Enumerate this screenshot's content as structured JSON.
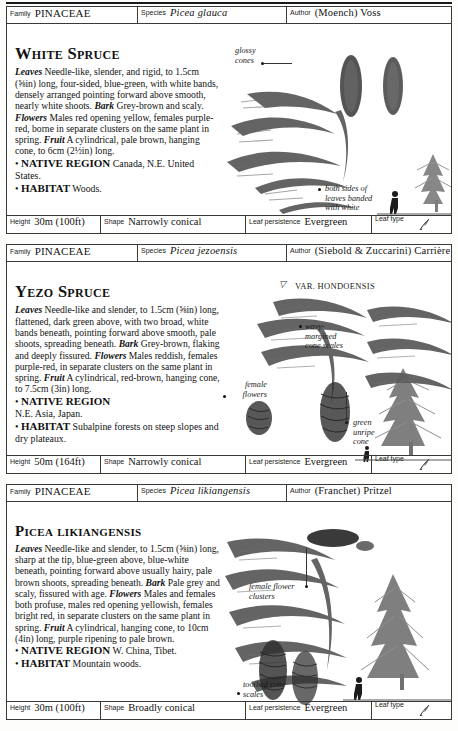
{
  "labels": {
    "family": "Family",
    "species": "Species",
    "author": "Author",
    "height": "Height",
    "shape": "Shape",
    "leaf_persistence": "Leaf persistence",
    "leaf_type": "Leaf type"
  },
  "entries": [
    {
      "family": "PINACEAE",
      "species": "Picea glauca",
      "author": "(Moench) Voss",
      "common_name": "White Spruce",
      "description": "Leaves Needle-like, slender, and rigid, to 1.5cm (⅝in) long, four-sided, blue-green, with white bands, densely arranged pointing forward above smooth, nearly white shoots. Bark Grey-brown and scaly. Flowers Males red opening yellow, females purple-red, borne in separate clusters on the same plant in spring. Fruit A cylindrical, pale brown, hanging cone, to 6cm (2½in) long.",
      "native_region_label": "NATIVE REGION",
      "native_region": "Canada, N.E. United States.",
      "habitat_label": "HABITAT",
      "habitat": "Woods.",
      "height": "30m (100ft)",
      "shape": "Narrowly conical",
      "leaf_persistence": "Evergreen",
      "callouts": [
        {
          "text": "glossy\ncones"
        },
        {
          "text": "both sides of\nleaves banded\nwith white"
        }
      ]
    },
    {
      "family": "PINACEAE",
      "species": "Picea jezoensis",
      "author": "(Siebold & Zuccarini) Carrière",
      "common_name": "Yezo Spruce",
      "variety_label": "VAR. HONDOENSIS",
      "description": "Leaves Needle-like and slender, to 1.5cm (⅝in) long, flattened, dark green above, with two broad, white bands beneath, pointing forward above smooth, pale shoots, spreading beneath. Bark Grey-brown, flaking and deeply fissured. Flowers Males reddish, females purple-red, in separate clusters on the same plant in spring. Fruit A cylindrical, red-brown, hanging cone, to 7.5cm (3in) long.",
      "native_region_label": "NATIVE REGION",
      "native_region": "N.E. Asia, Japan.",
      "habitat_label": "HABITAT",
      "habitat": "Subalpine forests on steep slopes and dry plateaux.",
      "height": "50m (164ft)",
      "shape": "Narrowly conical",
      "leaf_persistence": "Evergreen",
      "callouts": [
        {
          "text": "female\nflowers"
        },
        {
          "text": "wavy-\nmargined\ncone scales"
        },
        {
          "text": "green\nunripe\ncone"
        }
      ]
    },
    {
      "family": "PINACEAE",
      "species": "Picea likiangensis",
      "author": "(Franchet) Pritzel",
      "common_name": "Picea likiangensis",
      "description": "Leaves Needle-like and slender, to 1.5cm (⅝in) long, sharp at the tip, blue-green above, blue-white beneath, pointing forward above usually hairy, pale brown shoots, spreading beneath. Bark Pale grey and scaly, fissured with age. Flowers Males and females both profuse, males red opening yellowish, females bright red, in separate clusters on the same plant in spring. Fruit A cylindrical, hanging cone, to 10cm (4in) long, purple ripening to pale brown.",
      "native_region_label": "NATIVE REGION",
      "native_region": "W. China, Tibet.",
      "habitat_label": "HABITAT",
      "habitat": "Mountain woods.",
      "height": "30m (100ft)",
      "shape": "Broadly conical",
      "leaf_persistence": "Evergreen",
      "callouts": [
        {
          "text": "female flower\nclusters"
        },
        {
          "text": "toothed cone\nscales"
        }
      ]
    }
  ]
}
